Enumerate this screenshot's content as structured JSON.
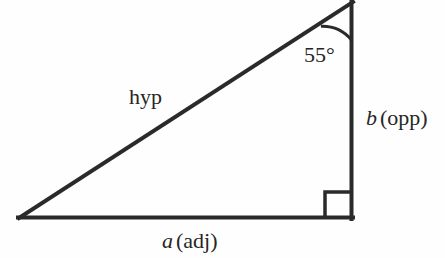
{
  "figure": {
    "background_color": "#fefefe",
    "stroke_color": "#2a2a2a",
    "text_color": "#262626"
  },
  "labels": {
    "hypotenuse": "hyp",
    "angle": "55°",
    "angle_value": 55,
    "angle_unit": "degrees",
    "adjacent_var": "a",
    "adjacent_note": "(adj)",
    "opposite_var": "b",
    "opposite_note": "(opp)"
  },
  "geometry": {
    "type": "right-triangle",
    "vertices": {
      "apex": [
        352,
        2
      ],
      "bottom_right": [
        352,
        217
      ],
      "bottom_left": [
        19,
        218
      ]
    },
    "right_angle_at": "bottom_right",
    "right_angle_marker_size": 25,
    "angle_arc_radius": 38,
    "line_width": 4
  }
}
